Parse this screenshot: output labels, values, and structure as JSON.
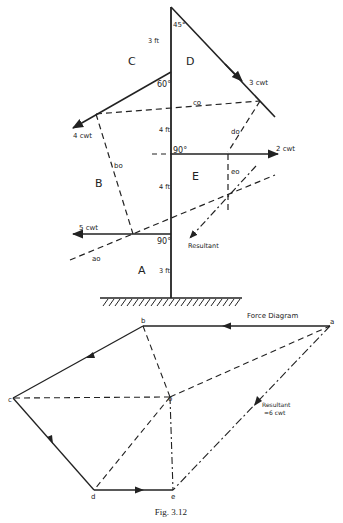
{
  "figure": {
    "caption": "Fig. 3.12"
  },
  "space_diagram": {
    "regions": [
      "A",
      "B",
      "C",
      "D",
      "E"
    ],
    "distances": [
      "3 ft",
      "4 ft",
      "4 ft",
      "3 ft"
    ],
    "angles": [
      "45°",
      "60°",
      "90°",
      "90°"
    ],
    "forces": [
      {
        "label": "3 cwt",
        "angle": "45°"
      },
      {
        "label": "4 cwt",
        "angle": "60°"
      },
      {
        "label": "2 cwt",
        "angle": "90°"
      },
      {
        "label": "5 cwt",
        "angle": "90°"
      }
    ],
    "link_labels": [
      "co",
      "do",
      "bo",
      "eo",
      "ao"
    ],
    "resultant_label": "Resultant"
  },
  "force_diagram": {
    "title": "Force Diagram",
    "points": [
      "a",
      "b",
      "c",
      "d",
      "e",
      "o"
    ],
    "resultant_label_1": "Resultant",
    "resultant_label_2": "=6 cwt"
  }
}
